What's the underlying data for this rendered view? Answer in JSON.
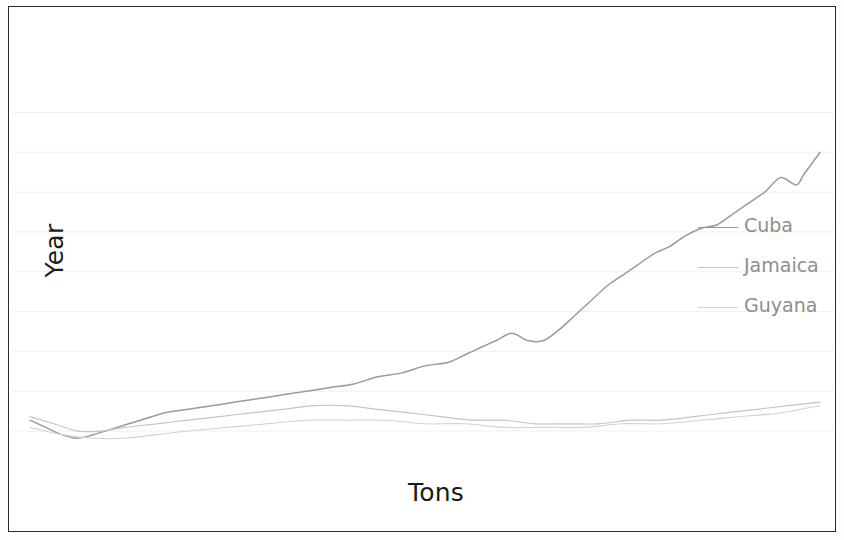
{
  "chart_data": {
    "type": "line",
    "title": "",
    "xlabel": "Tons",
    "ylabel": "Year",
    "grid": true,
    "legend_position": "center-right",
    "xlim": [
      0,
      100
    ],
    "ylim": [
      0,
      100
    ],
    "gridlines_y": [
      96,
      85,
      74,
      63,
      52,
      41,
      30,
      19,
      8
    ],
    "colors": {
      "cuba": "#9a9a9a",
      "jamaica": "#c4c4c4",
      "guyana": "#d2d2d2",
      "grid": "#f0f0f0",
      "frame": "#2c2c2c",
      "axis_text": "#1a1a1a",
      "legend_text": "#8e8e8e"
    },
    "series": [
      {
        "name": "Cuba",
        "color": "#9a9a9a",
        "x": [
          0,
          2,
          4,
          6,
          8,
          11,
          14,
          17,
          20,
          23,
          26,
          29,
          32,
          35,
          38,
          41,
          44,
          47,
          50,
          53,
          55,
          57,
          59,
          61,
          63,
          65,
          67,
          69,
          71,
          73,
          75,
          77,
          79,
          81,
          83,
          85,
          87,
          89,
          91,
          93,
          95,
          97,
          98,
          100
        ],
        "y": [
          11,
          9,
          7,
          6,
          7,
          9,
          11,
          13,
          14,
          15,
          16,
          17,
          18,
          19,
          20,
          21,
          23,
          24,
          26,
          27,
          29,
          31,
          33,
          35,
          33,
          33,
          36,
          40,
          44,
          48,
          51,
          54,
          57,
          59,
          62,
          64,
          65,
          68,
          71,
          74,
          78,
          76,
          79,
          85
        ]
      },
      {
        "name": "Jamaica",
        "color": "#c4c4c4",
        "x": [
          0,
          3,
          6,
          9,
          12,
          16,
          20,
          24,
          28,
          32,
          36,
          40,
          44,
          48,
          52,
          56,
          60,
          64,
          68,
          72,
          76,
          80,
          84,
          88,
          92,
          96,
          100
        ],
        "y": [
          12,
          10,
          8,
          8,
          9,
          10,
          11,
          12,
          13,
          14,
          15,
          15,
          14,
          13,
          12,
          11,
          11,
          10,
          10,
          10,
          11,
          11,
          12,
          13,
          14,
          15,
          16
        ]
      },
      {
        "name": "Guyana",
        "color": "#d2d2d2",
        "x": [
          0,
          4,
          8,
          12,
          16,
          20,
          25,
          30,
          35,
          40,
          45,
          50,
          55,
          60,
          65,
          70,
          75,
          80,
          85,
          90,
          95,
          100
        ],
        "y": [
          9,
          7,
          6,
          6,
          7,
          8,
          9,
          10,
          11,
          11,
          11,
          10,
          10,
          9,
          9,
          9,
          10,
          10,
          11,
          12,
          13,
          15
        ]
      }
    ]
  },
  "axes": {
    "ylabel": "Year",
    "xlabel": "Tons"
  },
  "legend": {
    "items": [
      {
        "label": "Cuba"
      },
      {
        "label": "Jamaica"
      },
      {
        "label": "Guyana"
      }
    ]
  }
}
